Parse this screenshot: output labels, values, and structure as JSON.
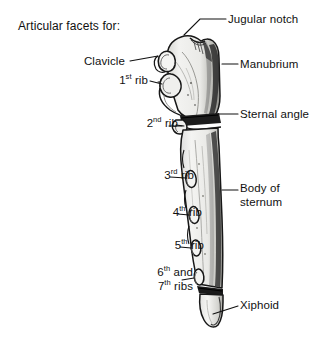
{
  "figure": {
    "title": "Articular facets for:",
    "background_color": "#ffffff",
    "ink_color": "#111111",
    "bone_fill_color": "#e8e8e6",
    "bone_shadow_color": "#2a2a2a"
  },
  "labels": {
    "title": {
      "text": "Articular facets for:"
    },
    "jugular_notch": {
      "text": "Jugular notch"
    },
    "manubrium": {
      "text": "Manubrium"
    },
    "sternal_angle": {
      "text": "Sternal angle"
    },
    "body_of_sternum_line1": {
      "text": "Body of"
    },
    "body_of_sternum_line2": {
      "text": "sternum"
    },
    "xiphoid": {
      "text": "Xiphoid"
    },
    "clavicle": {
      "text": "Clavicle"
    },
    "rib_1": {
      "num": "1",
      "sup": "st",
      "rest": "rib"
    },
    "rib_2": {
      "num": "2",
      "sup": "nd",
      "rest": "rib"
    },
    "rib_3": {
      "num": "3",
      "sup": "rd",
      "rest": "rib"
    },
    "rib_4": {
      "num": "4",
      "sup": "th",
      "rest": "rib"
    },
    "rib_5": {
      "num": "5",
      "sup": "th",
      "rest": "rib"
    },
    "rib_6": {
      "num": "6",
      "sup": "th",
      "rest": "and"
    },
    "rib_7": {
      "num": "7",
      "sup": "th",
      "rest": "ribs"
    }
  },
  "anatomy_parts": [
    {
      "name": "jugular-notch",
      "side": "right"
    },
    {
      "name": "manubrium",
      "side": "right"
    },
    {
      "name": "sternal-angle",
      "side": "right"
    },
    {
      "name": "body-of-sternum",
      "side": "right"
    },
    {
      "name": "xiphoid",
      "side": "right"
    },
    {
      "name": "clavicular-facet",
      "side": "left"
    },
    {
      "name": "first-rib-facet",
      "side": "left"
    },
    {
      "name": "second-rib-facet",
      "side": "left"
    },
    {
      "name": "third-rib-facet",
      "side": "left"
    },
    {
      "name": "fourth-rib-facet",
      "side": "left"
    },
    {
      "name": "fifth-rib-facet",
      "side": "left"
    },
    {
      "name": "sixth-seventh-rib-facets",
      "side": "left"
    }
  ]
}
